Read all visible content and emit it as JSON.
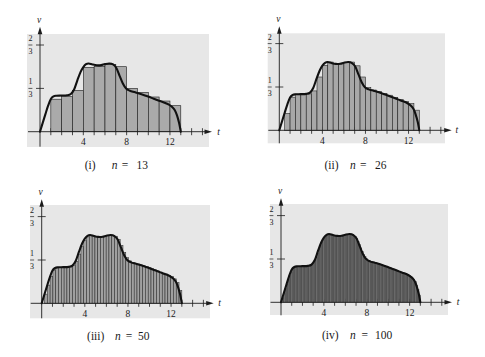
{
  "figure": {
    "captions": [
      {
        "roman": "(i)",
        "variable": "n",
        "equals": "=",
        "value": "13"
      },
      {
        "roman": "(ii)",
        "variable": "n",
        "equals": "=",
        "value": "26"
      },
      {
        "roman": "(iii)",
        "variable": "n",
        "equals": "=",
        "value": "50"
      },
      {
        "roman": "(iv)",
        "variable": "n",
        "equals": "=",
        "value": "100"
      }
    ]
  },
  "chart_data": [
    {
      "panel": "(i)",
      "type": "bar",
      "title": "(i) n = 13",
      "xlabel": "t",
      "ylabel": "v",
      "x_tick_labels": [
        "4",
        "8",
        "12"
      ],
      "x_tick_values": [
        4,
        8,
        12
      ],
      "x_minor_ticks": [
        1,
        2,
        3,
        4,
        5,
        6,
        7,
        8,
        9,
        10,
        11,
        12,
        13,
        14,
        15
      ],
      "y_ticks": [
        {
          "value": 0.6667,
          "numerator": "2",
          "denominator": "3"
        },
        {
          "value": 0.3333,
          "numerator": "1",
          "denominator": "3"
        }
      ],
      "xlim": [
        0,
        16
      ],
      "ylim": [
        0,
        0.75
      ],
      "grid": false,
      "legend": null,
      "n": 13,
      "interval": [
        0,
        13
      ],
      "rule": "left-endpoint",
      "bar_width": 1,
      "bar_heights": [
        0,
        0.25,
        0.27,
        0.318,
        0.495,
        0.503,
        0.518,
        0.5,
        0.333,
        0.303,
        0.267,
        0.236,
        0.2
      ],
      "curve": [
        [
          0,
          0
        ],
        [
          0.25,
          0.068
        ],
        [
          0.5,
          0.135
        ],
        [
          0.75,
          0.2
        ],
        [
          1,
          0.252
        ],
        [
          1.25,
          0.272
        ],
        [
          1.5,
          0.277
        ],
        [
          2,
          0.278
        ],
        [
          2.5,
          0.28
        ],
        [
          2.85,
          0.29
        ],
        [
          3.15,
          0.325
        ],
        [
          3.45,
          0.395
        ],
        [
          3.75,
          0.46
        ],
        [
          4,
          0.497
        ],
        [
          4.25,
          0.519
        ],
        [
          4.5,
          0.525
        ],
        [
          4.85,
          0.517
        ],
        [
          5.25,
          0.511
        ],
        [
          5.65,
          0.512
        ],
        [
          6,
          0.52
        ],
        [
          6.4,
          0.525
        ],
        [
          6.75,
          0.517
        ],
        [
          7.05,
          0.49
        ],
        [
          7.35,
          0.43
        ],
        [
          7.65,
          0.37
        ],
        [
          7.95,
          0.332
        ],
        [
          8.3,
          0.315
        ],
        [
          8.8,
          0.303
        ],
        [
          9.5,
          0.285
        ],
        [
          10,
          0.27
        ],
        [
          10.5,
          0.254
        ],
        [
          11,
          0.238
        ],
        [
          11.5,
          0.223
        ],
        [
          11.9,
          0.208
        ],
        [
          12.2,
          0.19
        ],
        [
          12.45,
          0.165
        ],
        [
          12.65,
          0.125
        ],
        [
          12.85,
          0.065
        ],
        [
          13,
          0
        ]
      ],
      "colors": {
        "background": "#e7e7e7",
        "bar_fill": "#aaaaaa",
        "bar_edge": "#1a1a1a",
        "curve": "#111111"
      }
    },
    {
      "panel": "(ii)",
      "type": "bar",
      "title": "(ii) n = 26",
      "xlabel": "t",
      "ylabel": "v",
      "x_tick_labels": [
        "4",
        "8",
        "12"
      ],
      "x_tick_values": [
        4,
        8,
        12
      ],
      "x_minor_ticks": [
        1,
        2,
        3,
        4,
        5,
        6,
        7,
        8,
        9,
        10,
        11,
        12,
        13,
        14,
        15
      ],
      "y_ticks": [
        {
          "value": 0.6667,
          "numerator": "2",
          "denominator": "3"
        },
        {
          "value": 0.3333,
          "numerator": "1",
          "denominator": "3"
        }
      ],
      "xlim": [
        0,
        16
      ],
      "ylim": [
        0,
        0.75
      ],
      "grid": false,
      "legend": null,
      "n": 26,
      "interval": [
        0,
        13
      ],
      "rule": "left-endpoint",
      "bar_width": 0.5,
      "bar_heights": [
        0,
        0.13,
        0.255,
        0.278,
        0.278,
        0.28,
        0.303,
        0.41,
        0.5,
        0.525,
        0.513,
        0.511,
        0.52,
        0.525,
        0.496,
        0.41,
        0.328,
        0.31,
        0.298,
        0.284,
        0.27,
        0.254,
        0.238,
        0.222,
        0.205,
        0.155
      ],
      "curve": [
        [
          0,
          0
        ],
        [
          0.25,
          0.068
        ],
        [
          0.5,
          0.135
        ],
        [
          0.75,
          0.2
        ],
        [
          1,
          0.252
        ],
        [
          1.25,
          0.272
        ],
        [
          1.5,
          0.277
        ],
        [
          2,
          0.278
        ],
        [
          2.5,
          0.28
        ],
        [
          2.85,
          0.29
        ],
        [
          3.15,
          0.325
        ],
        [
          3.45,
          0.395
        ],
        [
          3.75,
          0.46
        ],
        [
          4,
          0.497
        ],
        [
          4.25,
          0.519
        ],
        [
          4.5,
          0.525
        ],
        [
          4.85,
          0.517
        ],
        [
          5.25,
          0.511
        ],
        [
          5.65,
          0.512
        ],
        [
          6,
          0.52
        ],
        [
          6.4,
          0.525
        ],
        [
          6.75,
          0.517
        ],
        [
          7.05,
          0.49
        ],
        [
          7.35,
          0.43
        ],
        [
          7.65,
          0.37
        ],
        [
          7.95,
          0.332
        ],
        [
          8.3,
          0.315
        ],
        [
          8.8,
          0.303
        ],
        [
          9.5,
          0.285
        ],
        [
          10,
          0.27
        ],
        [
          10.5,
          0.254
        ],
        [
          11,
          0.238
        ],
        [
          11.5,
          0.223
        ],
        [
          11.9,
          0.208
        ],
        [
          12.2,
          0.19
        ],
        [
          12.45,
          0.165
        ],
        [
          12.65,
          0.125
        ],
        [
          12.85,
          0.065
        ],
        [
          13,
          0
        ]
      ],
      "colors": {
        "background": "#e7e7e7",
        "bar_fill": "#a8a8a8",
        "bar_edge": "#1a1a1a",
        "curve": "#111111"
      }
    },
    {
      "panel": "(iii)",
      "type": "bar",
      "title": "(iii) n = 50",
      "xlabel": "t",
      "ylabel": "v",
      "x_tick_labels": [
        "4",
        "8",
        "12"
      ],
      "x_tick_values": [
        4,
        8,
        12
      ],
      "x_minor_ticks": [
        1,
        2,
        3,
        4,
        5,
        6,
        7,
        8,
        9,
        10,
        11,
        12,
        13,
        14,
        15
      ],
      "y_ticks": [
        {
          "value": 0.6667,
          "numerator": "2",
          "denominator": "3"
        },
        {
          "value": 0.3333,
          "numerator": "1",
          "denominator": "3"
        }
      ],
      "xlim": [
        0,
        16
      ],
      "ylim": [
        0,
        0.75
      ],
      "grid": false,
      "legend": null,
      "n": 50,
      "interval": [
        0,
        13
      ],
      "rule": "left-endpoint",
      "bar_width": 0.26,
      "curve": [
        [
          0,
          0
        ],
        [
          0.25,
          0.068
        ],
        [
          0.5,
          0.135
        ],
        [
          0.75,
          0.2
        ],
        [
          1,
          0.252
        ],
        [
          1.25,
          0.272
        ],
        [
          1.5,
          0.277
        ],
        [
          2,
          0.278
        ],
        [
          2.5,
          0.28
        ],
        [
          2.85,
          0.29
        ],
        [
          3.15,
          0.325
        ],
        [
          3.45,
          0.395
        ],
        [
          3.75,
          0.46
        ],
        [
          4,
          0.497
        ],
        [
          4.25,
          0.519
        ],
        [
          4.5,
          0.525
        ],
        [
          4.85,
          0.517
        ],
        [
          5.25,
          0.511
        ],
        [
          5.65,
          0.512
        ],
        [
          6,
          0.52
        ],
        [
          6.4,
          0.525
        ],
        [
          6.75,
          0.517
        ],
        [
          7.05,
          0.49
        ],
        [
          7.35,
          0.43
        ],
        [
          7.65,
          0.37
        ],
        [
          7.95,
          0.332
        ],
        [
          8.3,
          0.315
        ],
        [
          8.8,
          0.303
        ],
        [
          9.5,
          0.285
        ],
        [
          10,
          0.27
        ],
        [
          10.5,
          0.254
        ],
        [
          11,
          0.238
        ],
        [
          11.5,
          0.223
        ],
        [
          11.9,
          0.208
        ],
        [
          12.2,
          0.19
        ],
        [
          12.45,
          0.165
        ],
        [
          12.65,
          0.125
        ],
        [
          12.85,
          0.065
        ],
        [
          13,
          0
        ]
      ],
      "colors": {
        "background": "#e7e7e7",
        "bar_fill": "#a0a0a0",
        "bar_edge": "#222222",
        "curve": "#111111"
      }
    },
    {
      "panel": "(iv)",
      "type": "bar",
      "title": "(iv) n = 100",
      "xlabel": "t",
      "ylabel": "v",
      "x_tick_labels": [
        "4",
        "8",
        "12"
      ],
      "x_tick_values": [
        4,
        8,
        12
      ],
      "x_minor_ticks": [
        1,
        2,
        3,
        4,
        5,
        6,
        7,
        8,
        9,
        10,
        11,
        12,
        13,
        14,
        15
      ],
      "y_ticks": [
        {
          "value": 0.6667,
          "numerator": "2",
          "denominator": "3"
        },
        {
          "value": 0.3333,
          "numerator": "1",
          "denominator": "3"
        }
      ],
      "xlim": [
        0,
        16
      ],
      "ylim": [
        0,
        0.75
      ],
      "grid": false,
      "legend": null,
      "n": 100,
      "interval": [
        0,
        13
      ],
      "rule": "left-endpoint",
      "bar_width": 0.13,
      "curve": [
        [
          0,
          0
        ],
        [
          0.25,
          0.068
        ],
        [
          0.5,
          0.135
        ],
        [
          0.75,
          0.2
        ],
        [
          1,
          0.252
        ],
        [
          1.25,
          0.272
        ],
        [
          1.5,
          0.277
        ],
        [
          2,
          0.278
        ],
        [
          2.5,
          0.28
        ],
        [
          2.85,
          0.29
        ],
        [
          3.15,
          0.325
        ],
        [
          3.45,
          0.395
        ],
        [
          3.75,
          0.46
        ],
        [
          4,
          0.497
        ],
        [
          4.25,
          0.519
        ],
        [
          4.5,
          0.525
        ],
        [
          4.85,
          0.517
        ],
        [
          5.25,
          0.511
        ],
        [
          5.65,
          0.512
        ],
        [
          6,
          0.52
        ],
        [
          6.4,
          0.525
        ],
        [
          6.75,
          0.517
        ],
        [
          7.05,
          0.49
        ],
        [
          7.35,
          0.43
        ],
        [
          7.65,
          0.37
        ],
        [
          7.95,
          0.332
        ],
        [
          8.3,
          0.315
        ],
        [
          8.8,
          0.303
        ],
        [
          9.5,
          0.285
        ],
        [
          10,
          0.27
        ],
        [
          10.5,
          0.254
        ],
        [
          11,
          0.238
        ],
        [
          11.5,
          0.223
        ],
        [
          11.9,
          0.208
        ],
        [
          12.2,
          0.19
        ],
        [
          12.45,
          0.165
        ],
        [
          12.65,
          0.125
        ],
        [
          12.85,
          0.065
        ],
        [
          13,
          0
        ]
      ],
      "colors": {
        "background": "#e7e7e7",
        "bar_fill": "#6e6e6e",
        "bar_edge": "#2a2a2a",
        "curve": "#111111"
      }
    }
  ]
}
